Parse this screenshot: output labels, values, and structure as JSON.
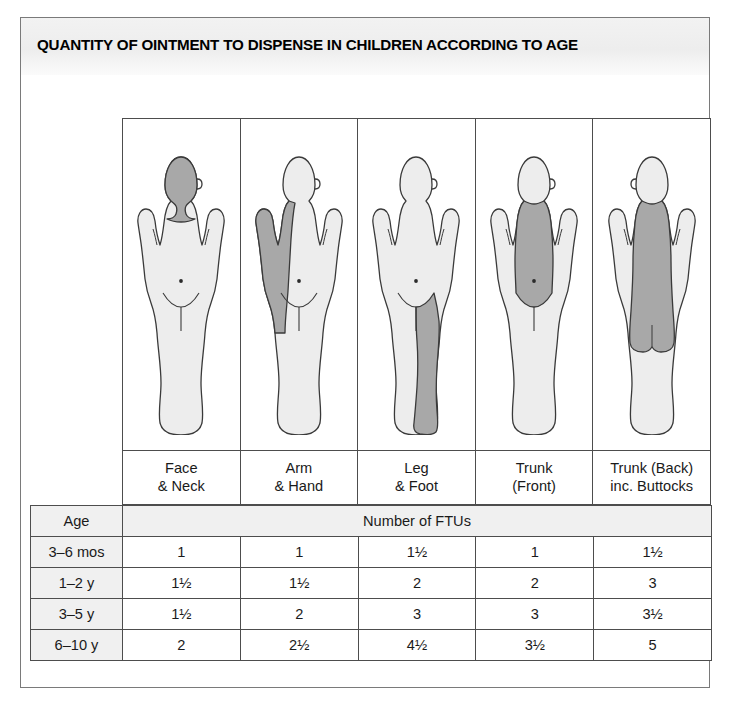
{
  "title": "QUANTITY OF OINTMENT TO DISPENSE IN CHILDREN ACCORDING TO AGE",
  "figures": [
    {
      "icon": "child-body-face-neck-icon",
      "region": "face-neck",
      "label_line1": "Face",
      "label_line2": "& Neck"
    },
    {
      "icon": "child-body-arm-hand-icon",
      "region": "arm-hand",
      "label_line1": "Arm",
      "label_line2": "& Hand"
    },
    {
      "icon": "child-body-leg-foot-icon",
      "region": "leg-foot",
      "label_line1": "Leg",
      "label_line2": "& Foot"
    },
    {
      "icon": "child-body-trunk-front-icon",
      "region": "trunk-front",
      "label_line1": "Trunk",
      "label_line2": "(Front)"
    },
    {
      "icon": "child-body-trunk-back-icon",
      "region": "trunk-back",
      "label_line1": "Trunk (Back)",
      "label_line2": "inc. Buttocks"
    }
  ],
  "table": {
    "age_header": "Age",
    "ftu_header": "Number of FTUs",
    "rows": [
      {
        "age": "3–6 mos",
        "values": [
          "1",
          "1",
          "1½",
          "1",
          "1½"
        ]
      },
      {
        "age": "1–2 y",
        "values": [
          "1½",
          "1½",
          "2",
          "2",
          "3"
        ]
      },
      {
        "age": "3–5 y",
        "values": [
          "1½",
          "2",
          "3",
          "3",
          "3½"
        ]
      },
      {
        "age": "6–10 y",
        "values": [
          "2",
          "2½",
          "4½",
          "3½",
          "5"
        ]
      }
    ]
  },
  "colors": {
    "shaded_region": "#a8a8a8",
    "body_fill": "#ededed",
    "outline": "#3a3a3a",
    "age_column_bg": "#f0f0f0",
    "grid_line": "#4d4d4d"
  }
}
